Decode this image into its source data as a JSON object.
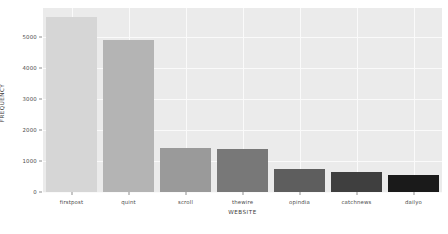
{
  "chart_data": {
    "type": "bar",
    "title": "",
    "xlabel": "WEBSITE",
    "ylabel": "FREQUENCY",
    "categories": [
      "firstpost",
      "quint",
      "scroll",
      "thewire",
      "opindia",
      "catchnews",
      "dailyo"
    ],
    "values": [
      5660,
      4900,
      1430,
      1400,
      740,
      640,
      550
    ],
    "bar_colors": [
      "#d6d6d6",
      "#b4b4b4",
      "#9a9a9a",
      "#787878",
      "#5e5e5e",
      "#3f3f3f",
      "#1a1a1a"
    ],
    "ylim": [
      0,
      5950
    ],
    "yticks": [
      0,
      1000,
      2000,
      3000,
      4000,
      5000
    ],
    "ytick_labels": [
      "0",
      "1000",
      "2000",
      "3000",
      "4000",
      "5000"
    ],
    "grid": true,
    "grid_color": "#fafafa",
    "legend": "none",
    "plot_background": "#ebebeb",
    "figure_background": "#ffffff",
    "tick_color": "#4d4d4d"
  }
}
